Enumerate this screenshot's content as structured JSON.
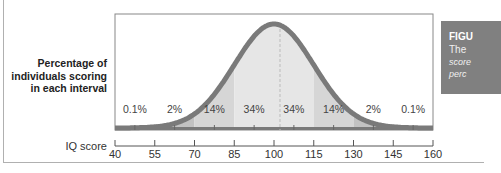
{
  "chart_data": {
    "type": "area",
    "title": "",
    "xlabel": "IQ score",
    "ylabel": "Percentage of individuals scoring in each interval",
    "x_ticks": [
      40,
      55,
      70,
      85,
      100,
      115,
      130,
      145,
      160
    ],
    "xlim": [
      40,
      160
    ],
    "distribution": "normal",
    "mean": 100,
    "sd": 15,
    "intervals": [
      {
        "range": [
          40,
          55
        ],
        "percent": "0.1%"
      },
      {
        "range": [
          55,
          70
        ],
        "percent": "2%"
      },
      {
        "range": [
          70,
          85
        ],
        "percent": "14%"
      },
      {
        "range": [
          85,
          100
        ],
        "percent": "34%"
      },
      {
        "range": [
          100,
          115
        ],
        "percent": "34%"
      },
      {
        "range": [
          115,
          130
        ],
        "percent": "14%"
      },
      {
        "range": [
          130,
          145
        ],
        "percent": "2%"
      },
      {
        "range": [
          145,
          160
        ],
        "percent": "0.1%"
      }
    ],
    "grid": false,
    "legend": null
  },
  "labels": {
    "ylabel_lines": [
      "Percentage of",
      "individuals scoring",
      "in each interval"
    ],
    "xlabel": "IQ score",
    "tick_labels": [
      "40",
      "55",
      "70",
      "85",
      "100",
      "115",
      "130",
      "145",
      "160"
    ],
    "percent_labels": [
      "0.1%",
      "2%",
      "14%",
      "34%",
      "34%",
      "14%",
      "2%",
      "0.1%"
    ]
  },
  "caption": {
    "title": "FIGU",
    "line1": "The",
    "line2": "score",
    "line3": "perc"
  },
  "colors": {
    "curve": "#7a7a7a",
    "fill_center": "#e6e6e6",
    "fill_mid": "#d6d6d6",
    "fill_outer": "#c2c2c2",
    "caption_bg": "#808080"
  }
}
